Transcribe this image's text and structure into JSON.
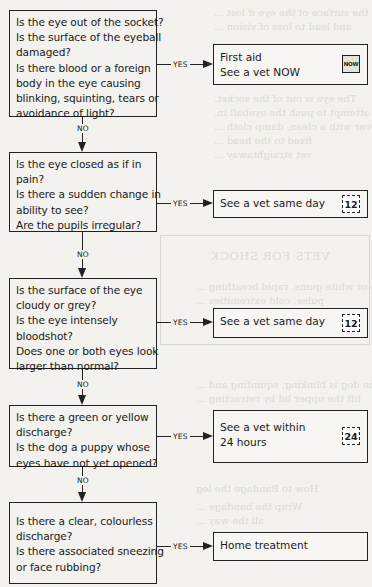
{
  "flowchart": {
    "yes_label": "YES",
    "no_label": "NO",
    "steps": [
      {
        "question_lines": [
          "Is the eye out of the socket?",
          "Is the surface of the eyeball",
          "damaged?",
          "Is there blood or a foreign",
          "body in the eye causing",
          "blinking, squinting, tears or",
          "avoidance of light?"
        ],
        "outcome_lines": [
          "First aid",
          "See a vet NOW"
        ],
        "urgency_badge": "NOW",
        "urgency_icon": "now-clock-icon"
      },
      {
        "question_lines": [
          "Is the eye closed as if in",
          "pain?",
          "Is there a sudden change in",
          "ability to see?",
          "Are the pupils irregular?"
        ],
        "outcome_lines": [
          "See a vet same day"
        ],
        "urgency_badge": "12",
        "urgency_icon": "12-hour-calendar-icon"
      },
      {
        "question_lines": [
          "Is the surface of the eye",
          "cloudy or grey?",
          "Is the eye intensely",
          "bloodshot?",
          "Does one or both eyes look",
          "larger than normal?"
        ],
        "outcome_lines": [
          "See a vet same day"
        ],
        "urgency_badge": "12",
        "urgency_icon": "12-hour-calendar-icon"
      },
      {
        "question_lines": [
          "Is there a green or yellow",
          "discharge?",
          "Is the dog a puppy whose",
          "eyes have not yet opened?"
        ],
        "outcome_lines": [
          "See a vet within",
          "24 hours"
        ],
        "urgency_badge": "24",
        "urgency_icon": "24-hour-calendar-icon"
      },
      {
        "question_lines": [
          "Is there a clear, colourless",
          "discharge?",
          "Is there associated sneezing",
          "or face rubbing?"
        ],
        "outcome_lines": [
          "Home treatment"
        ],
        "urgency_badge": null,
        "urgency_icon": null
      }
    ]
  },
  "colors": {
    "paper": "#f3f2ee",
    "ink": "#1a1a1a",
    "show_through": "#c9c8c3"
  }
}
